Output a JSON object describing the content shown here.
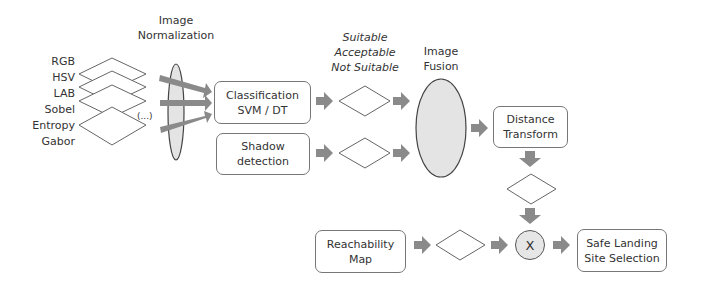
{
  "diagram": {
    "inputs": {
      "features": [
        "RGB",
        "HSV",
        "LAB",
        "Sobel",
        "Entropy",
        "Gabor"
      ],
      "ellipsis": "(...)"
    },
    "normalization": {
      "label_line1": "Image",
      "label_line2": "Normalization"
    },
    "classification": {
      "line1": "Classification",
      "line2": "SVM / DT"
    },
    "shadow": {
      "line1": "Shadow",
      "line2": "detection"
    },
    "classes": {
      "line1": "Suitable",
      "line2": "Acceptable",
      "line3": "Not Suitable"
    },
    "fusion": {
      "label_line1": "Image",
      "label_line2": "Fusion"
    },
    "distance": {
      "line1": "Distance",
      "line2": "Transform"
    },
    "reachability": {
      "line1": "Reachability",
      "line2": "Map"
    },
    "combine": {
      "symbol": "X"
    },
    "output": {
      "line1": "Safe Landing",
      "line2": "Site Selection"
    },
    "colors": {
      "arrow": "#8a8a8a",
      "stroke": "#666666",
      "ellipse_fill": "#e4e4e4",
      "box_border": "#777777"
    }
  }
}
